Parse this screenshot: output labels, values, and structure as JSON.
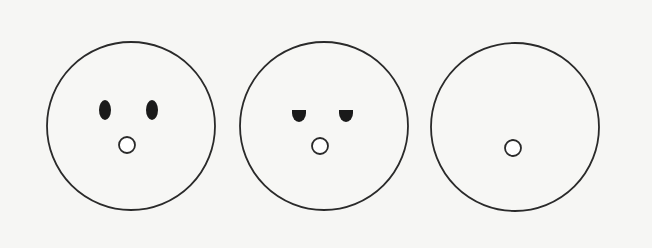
{
  "figure": {
    "background_color": "#f6f6f4",
    "stroke_color": "#2a2a2a",
    "fill_color": "#1a1a1a",
    "faces": [
      {
        "label": "Face 1",
        "eyes": "oval-filled",
        "head": {
          "cx": 131,
          "cy": 126,
          "r": 84
        },
        "left_eye": {
          "cx": 105,
          "cy": 110,
          "rx": 6,
          "ry": 10
        },
        "right_eye": {
          "cx": 152,
          "cy": 110,
          "rx": 6,
          "ry": 10
        },
        "mouth": {
          "cx": 127,
          "cy": 145,
          "r": 8
        }
      },
      {
        "label": "Face 2",
        "eyes": "half-closed-filled",
        "head": {
          "cx": 324,
          "cy": 126,
          "r": 84
        },
        "left_eye": {
          "cx": 299,
          "top": 110,
          "w": 14,
          "h": 12
        },
        "right_eye": {
          "cx": 346,
          "top": 110,
          "w": 14,
          "h": 12
        },
        "mouth": {
          "cx": 320,
          "cy": 146,
          "r": 8
        }
      },
      {
        "label": "Face 3",
        "eyes": "none",
        "head": {
          "cx": 515,
          "cy": 127,
          "r": 84
        },
        "mouth": {
          "cx": 513,
          "cy": 148,
          "r": 8
        }
      }
    ]
  }
}
